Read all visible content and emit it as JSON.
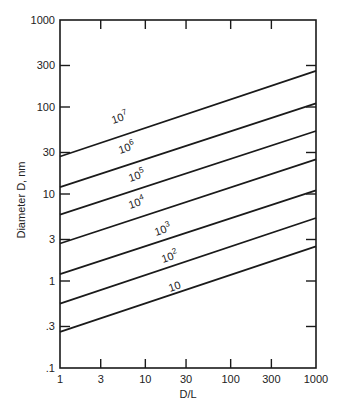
{
  "chart_data": {
    "type": "line",
    "title": "",
    "xlabel": "D/L",
    "ylabel": "Diameter D, nm",
    "xscale": "log",
    "yscale": "log",
    "xlim": [
      1,
      1000
    ],
    "ylim": [
      0.1,
      1000
    ],
    "grid": false,
    "legend": "inline labels on lines",
    "x_ticks": [
      1,
      3,
      10,
      30,
      100,
      300,
      1000
    ],
    "x_tick_labels": [
      "1",
      "3",
      "10",
      "30",
      "100",
      "300",
      "1000"
    ],
    "y_ticks": [
      0.1,
      0.3,
      1,
      3,
      10,
      30,
      100,
      300,
      1000
    ],
    "y_tick_labels": [
      ".1",
      ".3",
      "1",
      "3",
      "10",
      "30",
      "100",
      "300",
      "1000"
    ],
    "x": [
      1,
      1000
    ],
    "series": [
      {
        "name": "10^7",
        "label_base": "10",
        "label_exp": "7",
        "values": [
          27,
          260
        ],
        "label_at": [
          113,
          124
        ]
      },
      {
        "name": "10^6",
        "label_base": "10",
        "label_exp": "6",
        "values": [
          12,
          110
        ],
        "label_at": [
          120,
          154
        ]
      },
      {
        "name": "10^5",
        "label_base": "10",
        "label_exp": "5",
        "values": [
          5.8,
          53
        ],
        "label_at": [
          130,
          182
        ]
      },
      {
        "name": "10^4",
        "label_base": "10",
        "label_exp": "4",
        "values": [
          2.7,
          25
        ],
        "label_at": [
          130,
          209
        ]
      },
      {
        "name": "10^3",
        "label_base": "10",
        "label_exp": "3",
        "values": [
          1.2,
          11
        ],
        "label_at": [
          156,
          236
        ]
      },
      {
        "name": "10^2",
        "label_base": "10",
        "label_exp": "2",
        "values": [
          0.55,
          5.3
        ],
        "label_at": [
          163,
          263
        ]
      },
      {
        "name": "10",
        "label_base": "10",
        "label_exp": "",
        "values": [
          0.26,
          2.5
        ],
        "label_at": [
          170,
          292
        ]
      }
    ]
  },
  "colors": {
    "line": "#1a1a1a",
    "axis": "#1a1a1a",
    "background": "#ffffff"
  }
}
